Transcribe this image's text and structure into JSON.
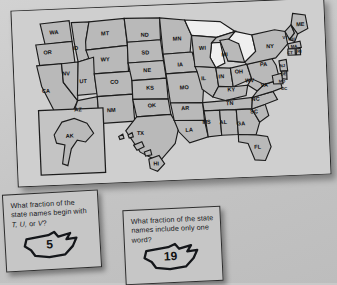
{
  "scene": {
    "background_color": "#c9c9c9",
    "poster": {
      "name": "united-states-map-poster",
      "fill_color": "#b9b9b9",
      "outline_color": "#1c1c1c",
      "water_color": "#efefef"
    }
  },
  "map": {
    "title": "United States state abbreviation map",
    "states": [
      {
        "abbr": "WA",
        "x": 40,
        "y": 22
      },
      {
        "abbr": "OR",
        "x": 33,
        "y": 41
      },
      {
        "abbr": "CA",
        "x": 30,
        "y": 78
      },
      {
        "abbr": "NV",
        "x": 50,
        "y": 62
      },
      {
        "abbr": "ID",
        "x": 60,
        "y": 38
      },
      {
        "abbr": "MT",
        "x": 89,
        "y": 25
      },
      {
        "abbr": "WY",
        "x": 88,
        "y": 50
      },
      {
        "abbr": "UT",
        "x": 66,
        "y": 70
      },
      {
        "abbr": "CO",
        "x": 96,
        "y": 72
      },
      {
        "abbr": "AZ",
        "x": 60,
        "y": 97
      },
      {
        "abbr": "NM",
        "x": 92,
        "y": 99
      },
      {
        "abbr": "ND",
        "x": 127,
        "y": 28
      },
      {
        "abbr": "SD",
        "x": 127,
        "y": 45
      },
      {
        "abbr": "NE",
        "x": 128,
        "y": 62
      },
      {
        "abbr": "KS",
        "x": 130,
        "y": 79
      },
      {
        "abbr": "OK",
        "x": 131,
        "y": 96
      },
      {
        "abbr": "TX",
        "x": 119,
        "y": 122
      },
      {
        "abbr": "MN",
        "x": 158,
        "y": 33
      },
      {
        "abbr": "IA",
        "x": 160,
        "y": 58
      },
      {
        "abbr": "MO",
        "x": 163,
        "y": 80
      },
      {
        "abbr": "AR",
        "x": 163,
        "y": 100
      },
      {
        "abbr": "LA",
        "x": 166,
        "y": 121
      },
      {
        "abbr": "WI",
        "x": 182,
        "y": 43
      },
      {
        "abbr": "IL",
        "x": 182,
        "y": 72
      },
      {
        "abbr": "MS",
        "x": 183,
        "y": 114
      },
      {
        "abbr": "MI",
        "x": 203,
        "y": 50
      },
      {
        "abbr": "IN",
        "x": 199,
        "y": 71
      },
      {
        "abbr": "OH",
        "x": 216,
        "y": 67
      },
      {
        "abbr": "KY",
        "x": 208,
        "y": 84
      },
      {
        "abbr": "TN",
        "x": 206,
        "y": 97
      },
      {
        "abbr": "AL",
        "x": 199,
        "y": 115
      },
      {
        "abbr": "GA",
        "x": 216,
        "y": 117
      },
      {
        "abbr": "FL",
        "x": 231,
        "y": 140
      },
      {
        "abbr": "SC",
        "x": 229,
        "y": 106
      },
      {
        "abbr": "NC",
        "x": 231,
        "y": 94
      },
      {
        "abbr": "WV",
        "x": 226,
        "y": 76
      },
      {
        "abbr": "VA",
        "x": 240,
        "y": 81
      },
      {
        "abbr": "PA",
        "x": 240,
        "y": 61
      },
      {
        "abbr": "NY",
        "x": 247,
        "y": 44
      },
      {
        "abbr": "ME",
        "x": 277,
        "y": 24
      },
      {
        "abbr": "VT",
        "x": 262,
        "y": 36
      },
      {
        "abbr": "NH",
        "x": 268,
        "y": 38
      },
      {
        "abbr": "MA",
        "x": 270,
        "y": 45
      },
      {
        "abbr": "CT",
        "x": 266,
        "y": 51
      },
      {
        "abbr": "RI",
        "x": 275,
        "y": 50
      },
      {
        "abbr": "NJ",
        "x": 258,
        "y": 63
      },
      {
        "abbr": "DE",
        "x": 259,
        "y": 71
      },
      {
        "abbr": "MD",
        "x": 257,
        "y": 78
      },
      {
        "abbr": "DC",
        "x": 259,
        "y": 85
      },
      {
        "abbr": "AK",
        "x": 51,
        "y": 122
      },
      {
        "abbr": "HI",
        "x": 133,
        "y": 152
      }
    ]
  },
  "cards": [
    {
      "name": "question-card-initial-letters",
      "question_part1": "What fraction of the state names begin with ",
      "question_italic": "T, U,",
      "question_part2": " or ",
      "question_italic2": "V",
      "question_end": "?",
      "question_full": "What fraction of the state names begin with T, U, or V?",
      "answer": "5"
    },
    {
      "name": "question-card-one-word",
      "question_full": "What fraction of the state names include only one word?",
      "answer": "19"
    }
  ]
}
